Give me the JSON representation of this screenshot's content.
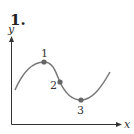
{
  "figure": {
    "problem_number": "1.",
    "axes": {
      "x_label": "x",
      "y_label": "y"
    },
    "curve": {
      "description": "sinusoidal curve rising to a local maximum, decreasing through an inflection point to a local minimum, then rising",
      "color": "#777777"
    },
    "points": [
      {
        "label": "1",
        "kind": "local maximum"
      },
      {
        "label": "2",
        "kind": "inflection point"
      },
      {
        "label": "3",
        "kind": "local minimum"
      }
    ],
    "point_color": "#666666"
  }
}
